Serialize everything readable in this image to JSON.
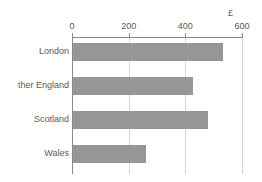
{
  "chart_data": {
    "type": "bar",
    "orientation": "horizontal",
    "title": "",
    "subtitle": "",
    "xlabel": "",
    "ylabel": "",
    "unit_label": "£",
    "categories": [
      "London",
      "ther England",
      "Scotland",
      "Wales"
    ],
    "values": [
      530,
      425,
      477,
      258
    ],
    "series": [
      {
        "name": "",
        "values": [
          530,
          425,
          477,
          258
        ]
      }
    ],
    "xlim": [
      0,
      600
    ],
    "xticks": [
      0,
      200,
      400,
      600
    ],
    "xtick_labels": [
      "0",
      "200",
      "400",
      "600"
    ],
    "grid": true,
    "grid_axis": "x",
    "legend": false,
    "legend_position": "none",
    "bar_color": "#969696",
    "axis_color": "#8a8a8c",
    "grid_color": "#d4d4d6",
    "text_color": "#59595b",
    "background": "#ffffff"
  }
}
